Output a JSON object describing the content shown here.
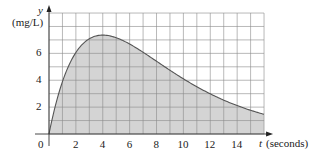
{
  "chart_data": {
    "type": "area",
    "title": "",
    "xlabel": "t (seconds)",
    "ylabel": "y (mg/L)",
    "x_axis_symbol": "t",
    "x_units": "(seconds)",
    "y_axis_symbol": "y",
    "y_units": "(mg/L)",
    "xlim": [
      0,
      16
    ],
    "ylim": [
      0,
      9
    ],
    "grid": true,
    "grid_step": 1,
    "x_ticks": [
      0,
      2,
      4,
      6,
      8,
      10,
      12,
      14
    ],
    "x_tick_labels": [
      "0",
      "2",
      "4",
      "6",
      "8",
      "10",
      "12",
      "14"
    ],
    "y_ticks": [
      2,
      4,
      6
    ],
    "y_tick_labels": [
      "2",
      "4",
      "6"
    ],
    "series": [
      {
        "name": "concentration",
        "x": [
          0,
          1,
          2,
          3,
          4,
          5,
          6,
          7,
          8,
          9,
          10,
          11,
          12,
          13,
          14,
          15,
          16
        ],
        "values": [
          0,
          3.9,
          6.07,
          7.09,
          7.36,
          7.16,
          6.69,
          6.08,
          5.41,
          4.74,
          4.1,
          3.52,
          2.99,
          2.52,
          2.11,
          1.76,
          1.47
        ]
      }
    ],
    "shaded_region": "area under curve from t=0 to t=16",
    "colors": {
      "fill": "#d4d4d4",
      "line": "#555555",
      "grid": "#8a8a8a"
    }
  }
}
